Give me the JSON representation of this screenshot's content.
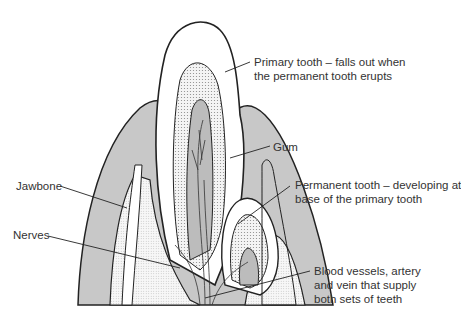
{
  "diagram": {
    "colors": {
      "gum": "#c8c8c8",
      "enamel": "#ffffff",
      "dentin_dots": "#e6e6e6",
      "bone_dots": "#ececec",
      "outline": "#222222",
      "label_text": "#333333"
    },
    "labels": [
      {
        "id": "primary-tooth",
        "lines": [
          "Primary tooth – falls out when",
          "the permanent tooth erupts"
        ]
      },
      {
        "id": "gum",
        "lines": [
          "Gum"
        ]
      },
      {
        "id": "jawbone",
        "lines": [
          "Jawbone"
        ]
      },
      {
        "id": "permanent-tooth",
        "lines": [
          "Permanent tooth – developing at",
          "base of the primary tooth"
        ]
      },
      {
        "id": "nerves",
        "lines": [
          "Nerves"
        ]
      },
      {
        "id": "blood-vessels",
        "lines": [
          "Blood vessels, artery",
          "and vein that supply",
          "both sets of teeth"
        ]
      }
    ]
  }
}
